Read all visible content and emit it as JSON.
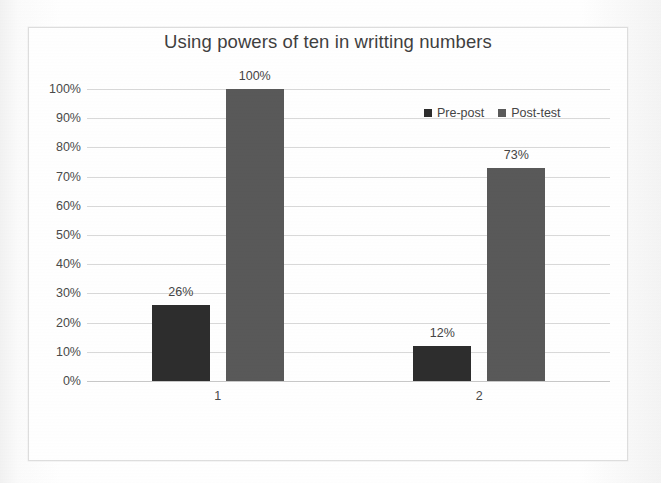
{
  "chart_data": {
    "type": "bar",
    "title": "Using powers of ten in writting numbers",
    "xlabel": "",
    "ylabel": "",
    "categories": [
      "1",
      "2"
    ],
    "series": [
      {
        "name": "Pre-post",
        "values": [
          26,
          12
        ],
        "color": "#2d2d2d"
      },
      {
        "name": "Post-test",
        "values": [
          100,
          73
        ],
        "color": "#595959"
      }
    ],
    "data_labels": [
      {
        "series": "Pre-post",
        "category": "1",
        "text": "26%"
      },
      {
        "series": "Post-test",
        "category": "1",
        "text": "100%"
      },
      {
        "series": "Pre-post",
        "category": "2",
        "text": "12%"
      },
      {
        "series": "Post-test",
        "category": "2",
        "text": "73%"
      }
    ],
    "ylim": [
      0,
      100
    ],
    "y_ticks": [
      0,
      10,
      20,
      30,
      40,
      50,
      60,
      70,
      80,
      90,
      100
    ],
    "y_tick_labels": [
      "0%",
      "10%",
      "20%",
      "30%",
      "40%",
      "50%",
      "60%",
      "70%",
      "80%",
      "90%",
      "100%"
    ],
    "grid": true,
    "grid_color": "#d9d9d9",
    "legend_position": "top-right",
    "value_suffix": "%"
  },
  "legend": {
    "entries": [
      {
        "label": "Pre-post",
        "marker": "square-marker-icon",
        "color": "#2d2d2d"
      },
      {
        "label": "Post-test",
        "marker": "square-marker-icon",
        "color": "#595959"
      }
    ]
  },
  "colors": {
    "series_pre_post": "#2d2d2d",
    "series_post_test": "#595959",
    "gridline": "#d9d9d9",
    "axis": "#c8c8c8",
    "text": "#4a4a4a",
    "title_text": "#3f3f3f",
    "frame_border": "#dedede",
    "background": "#ffffff"
  }
}
